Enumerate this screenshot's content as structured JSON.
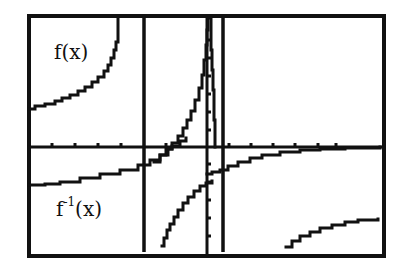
{
  "chart_data": {
    "type": "line",
    "title": "",
    "xlabel": "",
    "ylabel": "",
    "grid": false,
    "legend": "inline labels",
    "colors": {
      "background": "#ffffff",
      "ink": "#111111"
    },
    "frame": {
      "x1": 29,
      "y1": 16,
      "x2": 384,
      "y2": 256,
      "stroke": 4
    },
    "axes": {
      "x_axis_y": 147,
      "y_axis_x": 207,
      "x_ticks": [
        52,
        75,
        98,
        121,
        166,
        229,
        251,
        273,
        295,
        318,
        336
      ],
      "y_ticks": [
        40,
        58,
        76,
        94,
        112,
        130,
        164,
        182,
        200,
        218,
        236
      ]
    },
    "asymptotes": [
      {
        "name": "vertical-asymptote-left",
        "x": 144
      },
      {
        "name": "vertical-asymptote-right",
        "x": 223
      }
    ],
    "series": [
      {
        "name": "f(x)",
        "label_text": "f(x)",
        "label_pos": {
          "x": 54,
          "y": 42
        },
        "branches": [
          [
            [
              29,
              109
            ],
            [
              35,
              106
            ],
            [
              45,
              104
            ],
            [
              55,
              101
            ],
            [
              62,
              98
            ],
            [
              70,
              95
            ],
            [
              78,
              91
            ],
            [
              85,
              87
            ],
            [
              92,
              82
            ],
            [
              98,
              77
            ],
            [
              104,
              71
            ],
            [
              108,
              65
            ],
            [
              111,
              58
            ],
            [
              114,
              50
            ],
            [
              116,
              42
            ],
            [
              118,
              33
            ],
            [
              118,
              18
            ]
          ],
          [
            [
              154,
              162
            ],
            [
              160,
              155
            ],
            [
              166,
              149
            ],
            [
              172,
              143
            ],
            [
              178,
              136
            ],
            [
              183,
              128
            ],
            [
              187,
              120
            ],
            [
              191,
              111
            ],
            [
              195,
              100
            ],
            [
              199,
              88
            ],
            [
              202,
              75
            ],
            [
              204,
              60
            ],
            [
              206,
              45
            ],
            [
              207,
              30
            ],
            [
              208,
              18
            ]
          ],
          [
            [
              210,
              18
            ],
            [
              211,
              30
            ],
            [
              211,
              50
            ],
            [
              212,
              70
            ],
            [
              213,
              90
            ],
            [
              214,
              120
            ],
            [
              215,
              147
            ]
          ],
          [
            [
              286,
              247
            ],
            [
              292,
              241
            ],
            [
              300,
              236
            ],
            [
              310,
              232
            ],
            [
              320,
              228
            ],
            [
              332,
              225
            ],
            [
              345,
              222
            ],
            [
              358,
              220
            ],
            [
              378,
              219
            ]
          ]
        ]
      },
      {
        "name": "f^-1(x)",
        "label_text": "f",
        "label_sup": "-1",
        "label_suffix": "(x)",
        "label_pos": {
          "x": 56,
          "y": 198
        },
        "branches": [
          [
            [
              29,
              185
            ],
            [
              45,
              184
            ],
            [
              60,
              182
            ],
            [
              80,
              178
            ],
            [
              100,
              174
            ],
            [
              120,
              170
            ],
            [
              138,
              165
            ],
            [
              150,
              160
            ],
            [
              160,
              155
            ],
            [
              168,
              149
            ],
            [
              172,
              146
            ],
            [
              180,
              141
            ],
            [
              186,
              138
            ]
          ],
          [
            [
              162,
              246
            ],
            [
              164,
              238
            ],
            [
              167,
              230
            ],
            [
              170,
              224
            ],
            [
              174,
              217
            ],
            [
              178,
              210
            ],
            [
              183,
              203
            ],
            [
              188,
              197
            ],
            [
              194,
              191
            ],
            [
              200,
              186
            ],
            [
              206,
              183
            ],
            [
              212,
              181
            ]
          ],
          [
            [
              207,
              174
            ],
            [
              212,
              172
            ],
            [
              220,
              170
            ],
            [
              228,
              166
            ],
            [
              238,
              162
            ],
            [
              250,
              158
            ],
            [
              262,
              155
            ],
            [
              280,
              152
            ],
            [
              300,
              150
            ],
            [
              320,
              149
            ],
            [
              345,
              148
            ],
            [
              380,
              147
            ]
          ]
        ]
      }
    ]
  }
}
